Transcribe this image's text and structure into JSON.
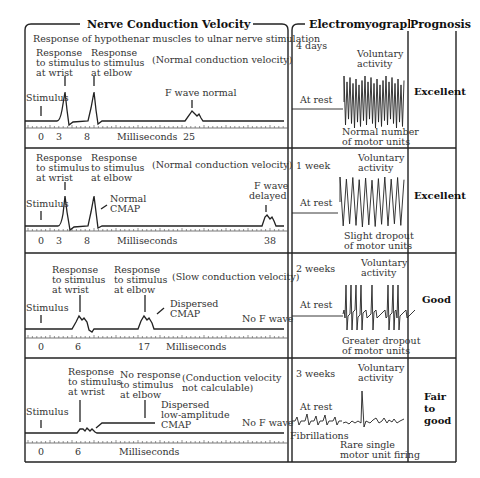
{
  "headers": {
    "ncv": "Nerve Conduction Velocity",
    "emg": "Electromyography",
    "prognosis": "Prognosis"
  },
  "subtitle": "Response of hypothenar muscles to ulnar nerve stimulation",
  "rows": [
    {
      "ncv": {
        "label_wrist": [
          "Response",
          "to stimulus",
          "at wrist"
        ],
        "label_elbow": [
          "Response",
          "to stimulus",
          "at elbow"
        ],
        "velocity_note": "(Normal conduction velocity)",
        "stimulus": "Stimulus",
        "f_wave": "F wave normal",
        "axis_label": "Milliseconds",
        "ticks": [
          "0",
          "3",
          "8",
          "25"
        ]
      },
      "emg": {
        "time": "4 days",
        "rest": "At rest",
        "voluntary": [
          "Voluntary",
          "activity"
        ],
        "caption": [
          "Normal number",
          "of motor units"
        ]
      },
      "prognosis": [
        "Excellent"
      ]
    },
    {
      "ncv": {
        "label_wrist": [
          "Response",
          "to stimulus",
          "at wrist"
        ],
        "label_elbow": [
          "Response",
          "to stimulus",
          "at elbow"
        ],
        "velocity_note": "(Normal conduction velocity)",
        "stimulus": "Stimulus",
        "cmap": [
          "Normal",
          "CMAP"
        ],
        "f_wave": [
          "F wave",
          "delayed"
        ],
        "axis_label": "Milliseconds",
        "ticks": [
          "0",
          "3",
          "8",
          "38"
        ]
      },
      "emg": {
        "time": "1 week",
        "rest": "At rest",
        "voluntary": [
          "Voluntary",
          "activity"
        ],
        "caption": [
          "Slight dropout",
          "of motor units"
        ]
      },
      "prognosis": [
        "Excellent"
      ]
    },
    {
      "ncv": {
        "label_wrist": [
          "Response",
          "to stimulus",
          "at wrist"
        ],
        "label_elbow": [
          "Response",
          "to stimulus",
          "at elbow"
        ],
        "velocity_note": "(Slow conduction velocity)",
        "stimulus": "Stimulus",
        "cmap": [
          "Dispersed",
          "CMAP"
        ],
        "f_wave": "No F wave",
        "axis_label": "Milliseconds",
        "ticks": [
          "0",
          "6",
          "17"
        ]
      },
      "emg": {
        "time": "2 weeks",
        "rest": "At rest",
        "voluntary": [
          "Voluntary",
          "activity"
        ],
        "caption": [
          "Greater dropout",
          "of motor units"
        ]
      },
      "prognosis": [
        "Good"
      ]
    },
    {
      "ncv": {
        "label_wrist": [
          "Response",
          "to stimulus",
          "at wrist"
        ],
        "label_elbow": [
          "No response",
          "to stimulus",
          "at elbow"
        ],
        "velocity_note": [
          "(Conduction velocity",
          "not calculable)"
        ],
        "stimulus": "Stimulus",
        "cmap": [
          "Dispersed",
          "low-amplitude",
          "CMAP"
        ],
        "f_wave": "No F wave",
        "axis_label": "Milliseconds",
        "ticks": [
          "0",
          "6"
        ]
      },
      "emg": {
        "time": "3 weeks",
        "rest": "At rest",
        "rest_caption": "Fibrillations",
        "voluntary": [
          "Voluntary",
          "activity"
        ],
        "caption": [
          "Rare single",
          "motor unit firing"
        ]
      },
      "prognosis": [
        "Fair",
        "to",
        "good"
      ]
    }
  ]
}
